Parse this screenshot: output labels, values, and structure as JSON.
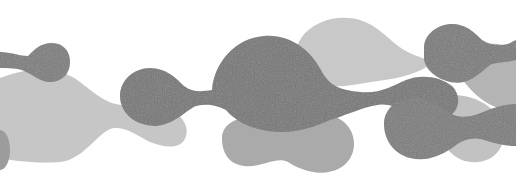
{
  "artwork": {
    "description": "abstract grayscale metaball blobs",
    "width": 516,
    "height": 186,
    "background": "#ffffff",
    "colors": {
      "light": "#c4c4c4",
      "mid": "#a8a8a8",
      "dark": "#7a7a7a",
      "darkest": "#6e6e6e"
    },
    "layers": [
      {
        "name": "light-band-left",
        "color": "#c6c6c6",
        "opacity": 1,
        "path": "M0,78 C20,70 55,62 80,82 C100,98 110,105 125,105 C140,105 148,100 160,104 C178,110 190,124 186,136 C182,150 165,148 150,142 C138,136 128,128 115,128 C100,128 85,160 60,162 C35,164 10,160 0,158 Z"
      },
      {
        "name": "light-blob-top-center",
        "color": "#c8c8c8",
        "opacity": 1,
        "path": "M300,40 C312,20 340,14 360,20 C378,26 385,36 398,46 C412,56 425,58 432,62 C424,72 400,78 385,80 C370,82 360,84 345,86 C325,88 306,78 300,62 C296,54 296,46 300,40 Z"
      },
      {
        "name": "light-blob-bottom-right",
        "color": "#c2c2c2",
        "opacity": 1,
        "path": "M440,98 C460,90 490,100 500,120 C510,138 500,160 478,162 C458,164 445,150 440,135 C436,122 430,106 440,98 Z"
      },
      {
        "name": "mid-blob-bottom-center",
        "color": "#aaaaaa",
        "opacity": 1,
        "path": "M222,138 C222,124 238,116 252,118 C266,120 276,128 292,120 C306,112 330,110 344,122 C358,134 358,158 340,168 C322,178 300,170 288,162 C276,156 262,168 244,166 C228,164 222,152 222,138 Z"
      },
      {
        "name": "mid-blob-far-right",
        "color": "#b0b0b0",
        "opacity": 0.95,
        "path": "M470,48 C488,40 510,44 516,52 L516,112 C505,110 492,108 480,98 C468,88 456,76 460,62 C462,56 465,51 470,48 Z"
      },
      {
        "name": "mid-sliver-left-edge",
        "color": "#9c9c9c",
        "opacity": 1,
        "path": "M0,130 C6,130 10,140 10,150 C10,160 6,170 0,170 Z"
      },
      {
        "name": "dark-blob-top-left",
        "color": "#7c7c7c",
        "opacity": 1,
        "path": "M0,52 C10,52 20,56 28,56 C34,50 40,43 52,43 C64,43 70,52 70,62 C70,74 62,82 50,82 C40,82 32,74 22,70 C14,68 6,68 0,68 Z"
      },
      {
        "name": "dark-chain-center",
        "color": "#767676",
        "opacity": 1,
        "path": "M120,96 C120,80 134,68 150,68 C166,68 176,78 184,86 C192,92 200,92 212,90 C214,62 236,38 264,36 C292,34 312,52 322,72 C330,86 340,90 360,92 C380,94 392,86 406,80 C420,74 440,76 452,86 C462,96 460,112 446,118 C432,124 418,118 406,112 C394,106 386,102 372,106 C356,110 344,116 330,120 C316,126 300,132 282,132 C256,132 236,122 226,110 C214,104 206,104 196,106 C186,110 176,124 156,126 C134,126 120,112 120,96 Z"
      },
      {
        "name": "dark-blob-top-right",
        "color": "#7a7a7a",
        "opacity": 1,
        "path": "M424,48 C424,34 438,24 452,24 C466,24 474,32 482,40 C492,46 500,46 508,44 C512,42 516,40 516,40 L516,60 C510,62 500,62 492,64 C484,68 478,78 464,82 C446,86 424,72 424,58 Z"
      },
      {
        "name": "dark-blob-bottom-right",
        "color": "#7b7b7b",
        "opacity": 1,
        "path": "M384,124 C384,108 398,98 414,98 C428,98 438,104 448,112 C458,118 466,118 478,114 C492,108 504,104 516,104 L516,146 C506,146 496,144 484,140 C472,136 462,140 452,148 C440,156 426,162 410,158 C394,154 384,140 384,124 Z"
      }
    ]
  }
}
